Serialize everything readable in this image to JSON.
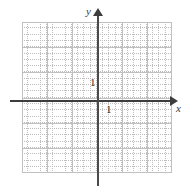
{
  "figure": {
    "kind": "cartesian-coordinate-grid",
    "width": 185,
    "height": 191,
    "background_color": "#ffffff"
  },
  "axes": {
    "x_axis_label": "x",
    "y_axis_label": "y",
    "axis_color": "#3d3d3d",
    "origin_px": {
      "x": 97,
      "y": 100
    },
    "x_axis_arrow": "arrow-right",
    "y_axis_arrow": "arrow-up"
  },
  "ticks": {
    "x": [
      {
        "value": "1",
        "label": "1"
      }
    ],
    "y": [
      {
        "value": "1",
        "label": "1"
      }
    ]
  },
  "grid": {
    "major_color": "#c0c0c0",
    "minor_color": "#bdbdbd",
    "major_spacing_px": 25,
    "minor_spacing_px": 6.25,
    "left_px": 22,
    "top_px": 22,
    "width_px": 150,
    "height_px": 151,
    "major_columns": 6,
    "major_rows": 6,
    "style": "major solid light gray, minor dotted"
  },
  "chart_data": {
    "type": "scatter",
    "title": "",
    "xlabel": "x",
    "ylabel": "y",
    "x": [],
    "y": [],
    "series": [],
    "xlim": [
      -3,
      3
    ],
    "ylim": [
      -3,
      3
    ],
    "xticks": [
      1
    ],
    "yticks": [
      1
    ],
    "xticklabels": [
      "1"
    ],
    "yticklabels": [
      "1"
    ],
    "grid": true,
    "legend": null,
    "annotations": [],
    "note": "Empty graph paper / blank coordinate plane with arrows on both axes and unit tick labels only."
  }
}
